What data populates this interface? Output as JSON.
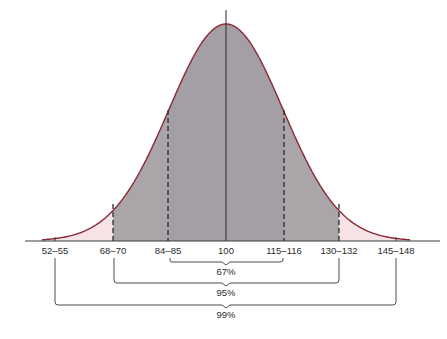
{
  "diagram": {
    "type": "normal-distribution",
    "mean_label": "100",
    "tick_labels": [
      "52–55",
      "68–70",
      "84–85",
      "100",
      "115–116",
      "130–132",
      "145–148"
    ],
    "brackets": [
      {
        "label": "67%",
        "from": "84–85",
        "to": "115–116"
      },
      {
        "label": "95%",
        "from": "68–70",
        "to": "130–132"
      },
      {
        "label": "99%",
        "from": "52–55",
        "to": "145–148"
      }
    ],
    "colors": {
      "curve": "#8a2a33",
      "inner_fill": "#a9a4a8",
      "tail_fill": "#f6e3e5",
      "axis": "#3a3a3a",
      "dashed": "#2a2a2a"
    }
  }
}
